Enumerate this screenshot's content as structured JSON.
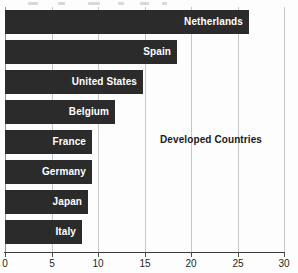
{
  "chart_data": {
    "type": "bar",
    "orientation": "horizontal",
    "title": "",
    "xlabel": "",
    "ylabel": "",
    "xlim": [
      0,
      30
    ],
    "grid": true,
    "gridlines": [
      0,
      5,
      10,
      15,
      20,
      25,
      30
    ],
    "xticks": [
      0,
      5,
      10,
      15,
      20,
      25,
      30
    ],
    "xtick_labels": [
      "0",
      "5",
      "10",
      "15",
      "20",
      "25",
      "30"
    ],
    "legend": null,
    "bar_color": "#2b2b2b",
    "label_color": "#ffffff",
    "categories": [
      "Netherlands",
      "Spain",
      "United States",
      "Belgium",
      "France",
      "Germany",
      "Japan",
      "Italy"
    ],
    "values": [
      26.2,
      18.5,
      14.8,
      11.8,
      9.4,
      9.4,
      8.9,
      8.3
    ],
    "annotations": [
      {
        "text": "Developed Countries",
        "x": 22.1,
        "row": 4
      }
    ]
  },
  "axis": {
    "ticks": [
      {
        "value": 0,
        "label": "0"
      },
      {
        "value": 5,
        "label": "5"
      },
      {
        "value": 10,
        "label": "10"
      },
      {
        "value": 15,
        "label": "15"
      },
      {
        "value": 20,
        "label": "20"
      },
      {
        "value": 25,
        "label": "25"
      },
      {
        "value": 30,
        "label": "30"
      }
    ]
  }
}
